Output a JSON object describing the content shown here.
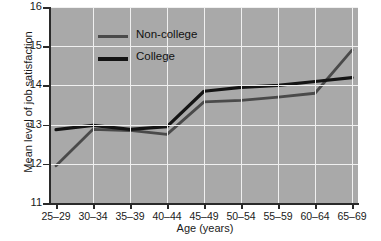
{
  "chart_data": {
    "type": "line",
    "title": "",
    "xlabel": "Age (years)",
    "ylabel": "Mean level of job satisfaction",
    "categories": [
      "25–29",
      "30–34",
      "35–39",
      "40–44",
      "45–49",
      "50–54",
      "55–59",
      "60–64",
      "65–69"
    ],
    "ylim": [
      11,
      16
    ],
    "yticks": [
      11,
      12,
      13,
      14,
      15,
      16
    ],
    "grid": true,
    "legend_position": "top-center-left",
    "plot_background": "#a9a9a9",
    "gridline_color": "#f0f0f0",
    "series": [
      {
        "name": "Non-college",
        "color": "#4a4a4a",
        "values": [
          11.95,
          12.88,
          12.85,
          12.75,
          13.58,
          13.62,
          13.7,
          13.8,
          14.9
        ]
      },
      {
        "name": "College",
        "color": "#141414",
        "values": [
          12.87,
          12.98,
          12.88,
          12.95,
          13.85,
          13.95,
          14.0,
          14.1,
          14.2
        ]
      }
    ]
  }
}
